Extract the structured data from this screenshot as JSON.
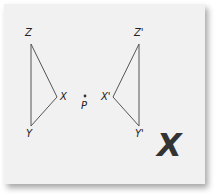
{
  "diagram": {
    "original_triangle": {
      "vertices": [
        "Z",
        "X",
        "Y"
      ]
    },
    "point": {
      "label": "P"
    },
    "image_triangle": {
      "vertices": [
        "Z'",
        "X'",
        "Y'"
      ]
    },
    "verdict_mark": "X",
    "colors": {
      "card": "#f1f1f1",
      "line": "#555555",
      "mark": "#333333"
    }
  }
}
